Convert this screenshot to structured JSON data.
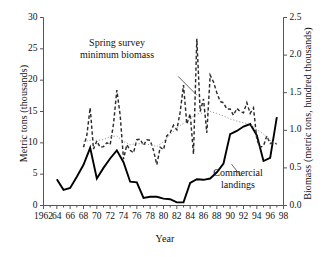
{
  "chart_data": {
    "type": "line",
    "title": "",
    "xlabel": "Year",
    "ylabel": "Metric tons (thousands)",
    "y2label": "Biomass (metric tons, hundred thousands)",
    "xlim": [
      1962,
      1998
    ],
    "ylim": [
      0,
      30
    ],
    "y2lim": [
      0.0,
      2.5
    ],
    "grid": false,
    "legend": "annotations-on-plot",
    "xticks": [
      "1962",
      "64",
      "66",
      "68",
      "70",
      "72",
      "74",
      "76",
      "78",
      "80",
      "82",
      "84",
      "86",
      "88",
      "90",
      "92",
      "94",
      "96",
      "98"
    ],
    "xtick_values": [
      1962,
      1964,
      1966,
      1968,
      1970,
      1972,
      1974,
      1976,
      1978,
      1980,
      1982,
      1984,
      1986,
      1988,
      1990,
      1992,
      1994,
      1996,
      1998
    ],
    "yticks": [
      "0",
      "5",
      "10",
      "15",
      "20",
      "25",
      "30"
    ],
    "ytick_values": [
      0,
      5,
      10,
      15,
      20,
      25,
      30
    ],
    "y2ticks": [
      "0.0",
      "0.5",
      "1.0",
      "1.5",
      "2.0",
      "2.5"
    ],
    "y2tick_values": [
      0.0,
      0.5,
      1.0,
      1.5,
      2.0,
      2.5
    ],
    "annotations": [
      {
        "name": "spring-survey-annotation",
        "line1": "Spring survey",
        "line2": "minimum biomass",
        "leader_from": [
          1982.2,
          20.6
        ],
        "leader_to": [
          1985.0,
          17.6
        ]
      },
      {
        "name": "commercial-landings-annotation",
        "line1": "Commercial",
        "line2": "landings",
        "leader_from": [
          1990.2,
          6.6
        ],
        "leader_to": [
          1991.6,
          4.7
        ]
      }
    ],
    "series": [
      {
        "name": "Commercial landings",
        "style": "solid",
        "color": "#000000",
        "axis": "left",
        "x": [
          1964,
          1965,
          1966,
          1967,
          1968,
          1969,
          1970,
          1971,
          1972,
          1973,
          1974,
          1975,
          1976,
          1977,
          1978,
          1979,
          1980,
          1981,
          1982,
          1983,
          1984,
          1985,
          1986,
          1987,
          1988,
          1989,
          1990,
          1991,
          1992,
          1993,
          1994,
          1995,
          1996,
          1997
        ],
        "values": [
          4.2,
          2.5,
          2.8,
          4.6,
          6.5,
          9.2,
          4.3,
          6.0,
          7.5,
          8.8,
          6.9,
          3.8,
          3.7,
          1.2,
          1.4,
          1.4,
          1.1,
          1.0,
          0.5,
          0.5,
          3.6,
          4.2,
          4.1,
          4.3,
          5.3,
          6.7,
          11.4,
          11.9,
          12.6,
          13.0,
          11.2,
          7.1,
          7.6,
          14.1
        ]
      },
      {
        "name": "Spring survey minimum biomass",
        "style": "dashed",
        "color": "#2b2b2b",
        "axis": "left",
        "x": [
          1968,
          1968.5,
          1969,
          1969.5,
          1970,
          1970.5,
          1971,
          1971.5,
          1972,
          1972.5,
          1973,
          1973.5,
          1974,
          1974.5,
          1975,
          1975.5,
          1976,
          1976.5,
          1977,
          1977.5,
          1978,
          1978.5,
          1979,
          1979.5,
          1980,
          1980.5,
          1981,
          1981.5,
          1982,
          1982.5,
          1983,
          1983.5,
          1984,
          1984.5,
          1985,
          1985.5,
          1986,
          1986.5,
          1987,
          1987.5,
          1988,
          1988.5,
          1989,
          1989.5,
          1990,
          1990.5,
          1991,
          1991.5,
          1992,
          1992.5,
          1993,
          1993.5,
          1994,
          1994.5,
          1995,
          1995.5,
          1996,
          1996.5,
          1997
        ],
        "values": [
          9.3,
          11.2,
          15.6,
          9.0,
          10.3,
          9.3,
          9.4,
          10.0,
          9.7,
          13.0,
          18.4,
          14.4,
          7.4,
          9.7,
          8.8,
          8.4,
          10.5,
          10.6,
          9.6,
          10.5,
          10.4,
          8.8,
          6.5,
          9.3,
          8.9,
          11.1,
          11.6,
          12.8,
          12.1,
          14.9,
          19.2,
          13.0,
          14.6,
          8.2,
          26.6,
          15.0,
          17.0,
          11.6,
          20.8,
          19.7,
          18.0,
          16.6,
          16.4,
          15.4,
          15.4,
          14.4,
          15.5,
          15.0,
          14.8,
          16.4,
          14.7,
          15.6,
          10.5,
          9.3,
          9.5,
          11.1,
          9.9,
          10.1,
          9.8
        ]
      },
      {
        "name": "Smoothed trend",
        "style": "dotted",
        "color": "#9a9a9a",
        "axis": "left",
        "x": [
          1968,
          1969,
          1970,
          1971,
          1972,
          1973,
          1974,
          1975,
          1976,
          1977,
          1978,
          1979,
          1980,
          1981,
          1982,
          1983,
          1984,
          1985,
          1986,
          1987,
          1988,
          1989,
          1990,
          1991,
          1992,
          1993,
          1994,
          1995,
          1996,
          1997
        ],
        "values": [
          10.2,
          10.4,
          10.4,
          10.5,
          11.0,
          11.1,
          10.2,
          9.7,
          9.9,
          9.8,
          9.7,
          9.4,
          10.2,
          11.3,
          12.4,
          13.1,
          13.9,
          14.6,
          14.8,
          15.0,
          14.7,
          14.3,
          13.8,
          13.5,
          13.2,
          13.0,
          12.1,
          11.4,
          10.4,
          9.9
        ]
      }
    ]
  },
  "axes": {
    "x_title": "Year",
    "y_left_title": "Metric tons (thousands)",
    "y_right_title": "Biomass (metric tons, hundred thousands)"
  }
}
